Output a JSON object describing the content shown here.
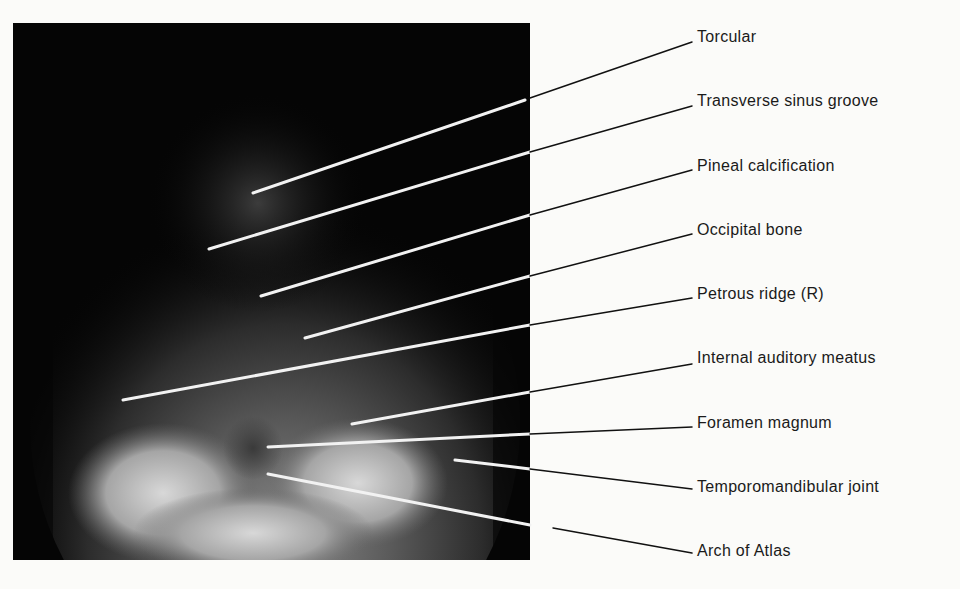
{
  "figure": {
    "type": "radiograph",
    "view": "skull, occipital (Towne) projection",
    "labels": [
      {
        "text": "Torcular",
        "label_y": 37,
        "line": {
          "x1": 253,
          "y1": 193,
          "x2": 525,
          "y2": 100,
          "x3": 692,
          "y3": 42
        }
      },
      {
        "text": "Transverse sinus groove",
        "label_y": 101,
        "line": {
          "x1": 209,
          "y1": 249,
          "x2": 530,
          "y2": 152,
          "x3": 692,
          "y3": 106
        }
      },
      {
        "text": "Pineal calcification",
        "label_y": 166,
        "line": {
          "x1": 261,
          "y1": 296,
          "x2": 530,
          "y2": 215,
          "x3": 692,
          "y3": 170
        }
      },
      {
        "text": "Occipital bone",
        "label_y": 230,
        "line": {
          "x1": 305,
          "y1": 338,
          "x2": 530,
          "y2": 276,
          "x3": 692,
          "y3": 234
        }
      },
      {
        "text": "Petrous ridge (R)",
        "label_y": 294,
        "line": {
          "x1": 123,
          "y1": 400,
          "x2": 530,
          "y2": 325,
          "x3": 692,
          "y3": 298
        }
      },
      {
        "text": "Internal auditory meatus",
        "label_y": 358,
        "line": {
          "x1": 352,
          "y1": 424,
          "x2": 530,
          "y2": 392,
          "x3": 692,
          "y3": 364
        }
      },
      {
        "text": "Foramen magnum",
        "label_y": 423,
        "line": {
          "x1": 268,
          "y1": 447,
          "x2": 530,
          "y2": 434,
          "x3": 692,
          "y3": 427
        }
      },
      {
        "text": "Temporomandibular joint",
        "label_y": 487,
        "line": {
          "x1": 455,
          "y1": 460,
          "x2": 530,
          "y2": 469,
          "x3": 692,
          "y3": 489
        }
      },
      {
        "text": "Arch of Atlas",
        "label_y": 551,
        "line": {
          "x1": 268,
          "y1": 474,
          "x2": 530,
          "y2": 525,
          "x3": 692,
          "y3": 553,
          "gap_start_x": 553,
          "gap_start_y": 528
        }
      }
    ],
    "colors": {
      "background": "#fbfbf9",
      "film": "#050505",
      "pointer_on_film": "#f2f2f2",
      "pointer_on_paper": "#111111",
      "label_text": "#1a1a1a"
    }
  }
}
